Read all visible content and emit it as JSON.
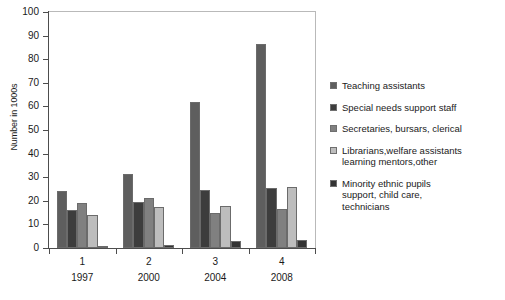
{
  "chart_data": {
    "type": "bar",
    "title": "",
    "subtitle": "",
    "xlabel": "",
    "ylabel": "Number in 1000s",
    "ylim": [
      0,
      100
    ],
    "yticks": [
      0,
      10,
      20,
      30,
      40,
      50,
      60,
      70,
      80,
      90,
      100
    ],
    "grid": false,
    "legend_position": "right",
    "categories": [
      "1",
      "2",
      "3",
      "4"
    ],
    "category_sublabels": [
      "1997",
      "2000",
      "2004",
      "2008"
    ],
    "series": [
      {
        "name": "Teaching assistants",
        "color": "#5e5e5e",
        "values": [
          24,
          31.3,
          62,
          86.5
        ]
      },
      {
        "name": "Special needs support staff",
        "color": "#3d3d3d",
        "values": [
          16.3,
          19.3,
          24.5,
          25.5
        ]
      },
      {
        "name": "Secretaries, bursars, clerical",
        "color": "#808080",
        "values": [
          19.2,
          21,
          15,
          16.5
        ]
      },
      {
        "name": "Librarians,welfare assistants\nlearning mentors,other",
        "color": "#bdbdbd",
        "values": [
          14,
          17.2,
          18,
          26
        ]
      },
      {
        "name": "Minority ethnic pupils\n support, child care,\n technicians",
        "color": "#333333",
        "values": [
          0.8,
          1.4,
          3,
          3.5
        ]
      }
    ]
  },
  "axis": {
    "y_title": "Number in 1000s"
  },
  "colors": {
    "frame": "#b9b9b9",
    "axis": "#4d4d4d",
    "background": "#ffffff",
    "text": "#1a1a1a"
  }
}
